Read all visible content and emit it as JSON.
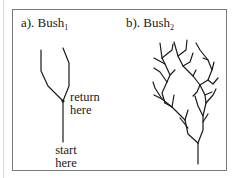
{
  "figure": {
    "panel_a": {
      "label_prefix": "a). Bush",
      "label_subscript": "1",
      "annotations": {
        "return": [
          "return",
          "here"
        ],
        "start": [
          "start",
          "here"
        ]
      }
    },
    "panel_b": {
      "label_prefix": "b). Bush",
      "label_subscript": "2"
    },
    "colors": {
      "stroke": "#1a1a1a",
      "frame": "#7a7a7a",
      "background": "#ffffff"
    }
  }
}
